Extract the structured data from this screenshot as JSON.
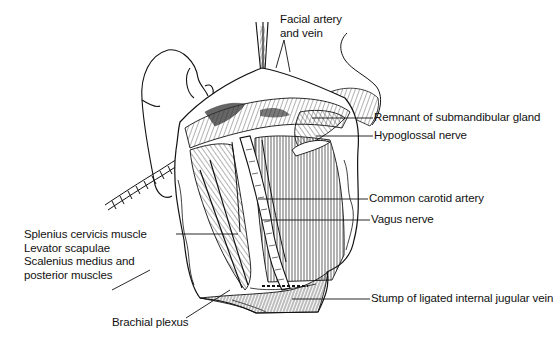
{
  "figure": {
    "labels": [
      {
        "id": "facial",
        "lines": [
          "Facial artery",
          "and vein"
        ]
      },
      {
        "id": "submandibular",
        "lines": [
          "Remnant of submandibular gland"
        ]
      },
      {
        "id": "hypoglossal",
        "lines": [
          "Hypoglossal nerve"
        ]
      },
      {
        "id": "carotid",
        "lines": [
          "Common carotid artery"
        ]
      },
      {
        "id": "vagus",
        "lines": [
          "Vagus nerve"
        ]
      },
      {
        "id": "muscles",
        "lines": [
          "Splenius cervicis muscle",
          "Levator scapulae",
          "Scalenius medius and",
          "posterior muscles"
        ]
      },
      {
        "id": "jugular",
        "lines": [
          "Stump of ligated internal jugular vein"
        ]
      },
      {
        "id": "brachial",
        "lines": [
          "Brachial plexus"
        ]
      }
    ]
  }
}
